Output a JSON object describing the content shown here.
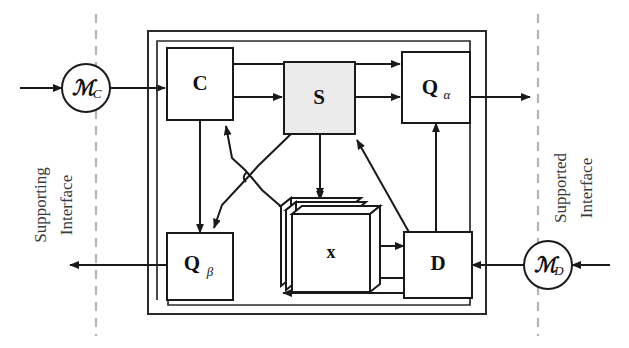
{
  "diagram": {
    "blocks": [
      {
        "id": "C",
        "label": "C",
        "sub": "",
        "shaded": false
      },
      {
        "id": "S",
        "label": "S",
        "sub": "",
        "shaded": true
      },
      {
        "id": "Qa",
        "label": "Q",
        "sub": "α",
        "shaded": false
      },
      {
        "id": "Qb",
        "label": "Q",
        "sub": "β",
        "shaded": false
      },
      {
        "id": "D",
        "label": "D",
        "sub": "",
        "shaded": false
      },
      {
        "id": "x",
        "label": "x",
        "sub": "",
        "shaded": false
      }
    ],
    "circles": [
      {
        "id": "MC",
        "label": "ℳ",
        "sub": "C"
      },
      {
        "id": "MD",
        "label": "ℳ",
        "sub": "D"
      }
    ],
    "side_labels": {
      "left_line1": "Supporting",
      "left_line2": "Interface",
      "right_line1": "Supported",
      "right_line2": "Interface"
    },
    "colors": {
      "stroke": "#1a1a1a",
      "frame": "#2b2b2b",
      "shaded_fill": "#ebebeb",
      "dashed_divider": "#b4b4b4",
      "background": "#ffffff",
      "side_label_text": "#3a3a3a"
    }
  }
}
